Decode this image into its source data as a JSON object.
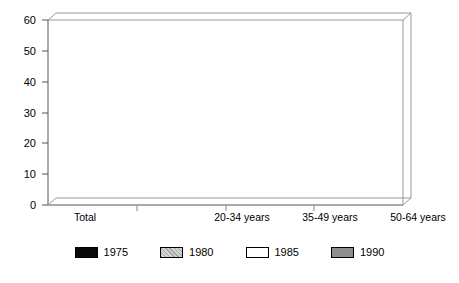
{
  "chart_data": {
    "type": "bar",
    "title": "",
    "subtitle": "",
    "xlabel": "",
    "ylabel": "",
    "ylim": [
      0,
      60
    ],
    "yticks": [
      0,
      10,
      20,
      30,
      40,
      50,
      60
    ],
    "grid": false,
    "legend_position": "bottom",
    "style": "3d-clustered-column",
    "categories": [
      "Total",
      "20-34 years",
      "35-49 years",
      "50-64 years"
    ],
    "series": [
      {
        "name": "1975",
        "color": "#0a0a0a",
        "values": [
          45,
          42,
          44.5,
          48
        ]
      },
      {
        "name": "1980",
        "color": "#d4d4d4",
        "values": [
          44.5,
          41,
          43,
          50
        ]
      },
      {
        "name": "1985",
        "color": "#ffffff",
        "values": [
          45,
          42,
          43.5,
          50
        ]
      },
      {
        "name": "1990",
        "color": "#8e8e8e",
        "values": [
          44,
          40,
          41.5,
          51.5
        ]
      }
    ]
  },
  "axis": {
    "y_tick_labels": [
      "0",
      "10",
      "20",
      "30",
      "40",
      "50",
      "60"
    ]
  },
  "legend": {
    "items": [
      {
        "label": "1975",
        "swatch": "legend-swatch-1975"
      },
      {
        "label": "1980",
        "swatch": "legend-swatch-1980"
      },
      {
        "label": "1985",
        "swatch": "legend-swatch-1985"
      },
      {
        "label": "1990",
        "swatch": "legend-swatch-1990"
      }
    ]
  }
}
